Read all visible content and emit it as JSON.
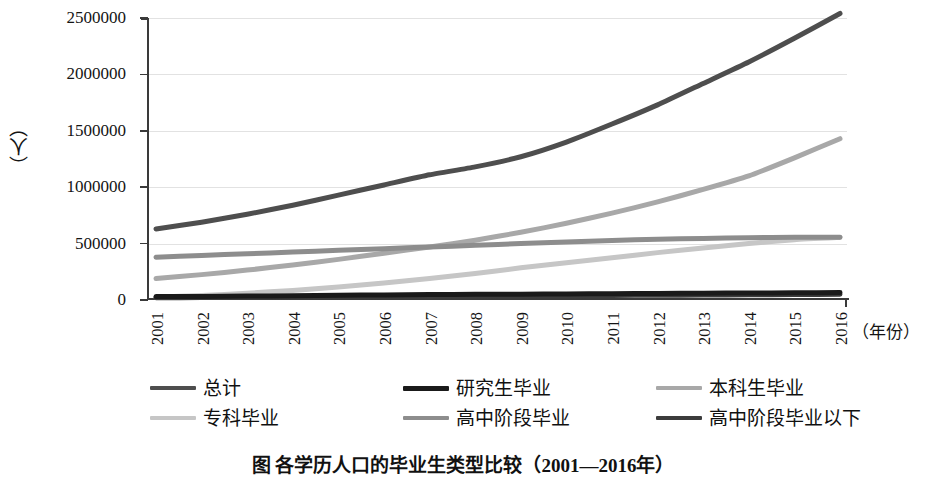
{
  "chart_data": {
    "type": "line",
    "title": "",
    "xlabel": "（年份）",
    "ylabel": "（人）",
    "ylim": [
      0,
      2500000
    ],
    "xlim": [
      2001,
      2016
    ],
    "grid": true,
    "legend_position": "bottom",
    "categories": [
      "2001",
      "2002",
      "2003",
      "2004",
      "2005",
      "2006",
      "2007",
      "2008",
      "2009",
      "2010",
      "2011",
      "2012",
      "2013",
      "2014",
      "2015",
      "2016"
    ],
    "ytick_labels": [
      "0",
      "500000",
      "1000000",
      "1500000",
      "2000000",
      "2500000"
    ],
    "ytick_values": [
      0,
      500000,
      1000000,
      1500000,
      2000000,
      2500000
    ],
    "series": [
      {
        "name": "总计",
        "color": "#4e4e4e",
        "width": 5,
        "values": [
          630000,
          690000,
          760000,
          840000,
          930000,
          1020000,
          1110000,
          1180000,
          1270000,
          1400000,
          1560000,
          1730000,
          1920000,
          2110000,
          2320000,
          2540000
        ]
      },
      {
        "name": "研究生毕业",
        "color": "#1a1a1a",
        "width": 5,
        "values": [
          30000,
          32000,
          35000,
          38000,
          42000,
          45000,
          48000,
          50000,
          52000,
          54000,
          56000,
          58000,
          60000,
          62000,
          64000,
          66000
        ]
      },
      {
        "name": "本科生毕业",
        "color": "#a8a8a8",
        "width": 5,
        "values": [
          190000,
          225000,
          265000,
          310000,
          360000,
          415000,
          470000,
          530000,
          600000,
          680000,
          770000,
          870000,
          980000,
          1100000,
          1260000,
          1430000
        ]
      },
      {
        "name": "专科毕业",
        "color": "#c6c6c6",
        "width": 5,
        "values": [
          25000,
          40000,
          60000,
          85000,
          115000,
          150000,
          190000,
          235000,
          285000,
          330000,
          375000,
          420000,
          460000,
          500000,
          535000,
          555000
        ]
      },
      {
        "name": "高中阶段毕业",
        "color": "#8d8d8d",
        "width": 5,
        "values": [
          380000,
          395000,
          410000,
          425000,
          440000,
          455000,
          470000,
          485000,
          500000,
          515000,
          528000,
          538000,
          546000,
          552000,
          556000,
          556000
        ]
      },
      {
        "name": "高中阶段毕业以下",
        "color": "#3c3c3c",
        "width": 5,
        "values": [
          20000,
          22000,
          24000,
          26000,
          28000,
          30000,
          32000,
          34000,
          36000,
          38000,
          40000,
          42000,
          44000,
          46000,
          48000,
          50000
        ]
      }
    ]
  },
  "axis": {
    "y_label": "（人）",
    "x_title": "（年份）"
  },
  "legend": {
    "items": [
      {
        "label": "总计",
        "color": "#4e4e4e"
      },
      {
        "label": "研究生毕业",
        "color": "#1a1a1a"
      },
      {
        "label": "本科生毕业",
        "color": "#a8a8a8"
      },
      {
        "label": "专科毕业",
        "color": "#c6c6c6"
      },
      {
        "label": "高中阶段毕业",
        "color": "#8d8d8d"
      },
      {
        "label": "高中阶段毕业以下",
        "color": "#3c3c3c"
      }
    ]
  },
  "caption": {
    "text": "图    各学历人口的毕业生类型比较（2001—2016年）"
  }
}
